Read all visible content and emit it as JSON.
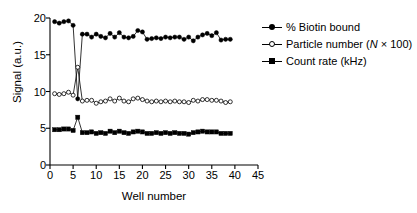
{
  "chart_data": {
    "type": "line",
    "title": "",
    "xlabel": "Well number",
    "ylabel": "Signal (a.u.)",
    "xlim": [
      0,
      45
    ],
    "ylim": [
      0,
      20
    ],
    "xticks": [
      0,
      5,
      10,
      15,
      20,
      25,
      30,
      35,
      40,
      45
    ],
    "yticks": [
      0,
      5,
      10,
      15,
      20
    ],
    "grid": false,
    "legend_position": "right",
    "x": [
      1,
      2,
      3,
      4,
      5,
      6,
      7,
      8,
      9,
      10,
      11,
      12,
      13,
      14,
      15,
      16,
      17,
      18,
      19,
      20,
      21,
      22,
      23,
      24,
      25,
      26,
      27,
      28,
      29,
      30,
      31,
      32,
      33,
      34,
      35,
      36,
      37,
      38,
      39
    ],
    "series": [
      {
        "name": "% Biotin bound",
        "marker": "filled-circle",
        "color": "#000000",
        "values": [
          19.5,
          19.3,
          19.5,
          19.6,
          19.0,
          9.0,
          17.8,
          17.8,
          17.4,
          17.8,
          17.5,
          17.3,
          17.9,
          17.4,
          18.0,
          17.4,
          17.3,
          17.5,
          18.3,
          18.1,
          17.1,
          17.2,
          17.3,
          17.2,
          17.4,
          17.3,
          17.4,
          17.4,
          17.1,
          17.4,
          16.9,
          17.4,
          17.7,
          17.9,
          17.6,
          18.0,
          17.0,
          17.1,
          17.1
        ]
      },
      {
        "name": "Particle number (N × 100)",
        "marker": "open-circle",
        "color": "#000000",
        "values": [
          9.7,
          9.6,
          9.7,
          9.9,
          9.5,
          13.3,
          8.7,
          8.8,
          8.8,
          8.4,
          8.6,
          8.7,
          9.0,
          8.7,
          9.1,
          8.7,
          8.6,
          9.0,
          9.1,
          8.9,
          8.7,
          8.6,
          8.7,
          8.6,
          8.7,
          8.6,
          8.7,
          8.6,
          8.6,
          8.5,
          8.8,
          8.7,
          8.9,
          8.9,
          8.8,
          8.8,
          8.7,
          8.5,
          8.6
        ]
      },
      {
        "name": "Count rate (kHz)",
        "marker": "filled-square",
        "color": "#000000",
        "values": [
          4.8,
          4.8,
          4.9,
          4.9,
          4.7,
          6.5,
          4.4,
          4.4,
          4.5,
          4.3,
          4.4,
          4.3,
          4.6,
          4.4,
          4.6,
          4.4,
          4.3,
          4.5,
          4.6,
          4.5,
          4.3,
          4.3,
          4.4,
          4.3,
          4.4,
          4.3,
          4.4,
          4.3,
          4.3,
          4.2,
          4.4,
          4.5,
          4.6,
          4.5,
          4.5,
          4.5,
          4.3,
          4.3,
          4.3
        ]
      }
    ]
  },
  "legend": {
    "items": [
      {
        "label": "% Biotin bound",
        "marker": "filled-circle-icon"
      },
      {
        "label_pre": "Particle number (",
        "label_italic": "N",
        "label_post": " × 100)",
        "marker": "open-circle-icon"
      },
      {
        "label": "Count rate (kHz)",
        "marker": "filled-square-icon"
      }
    ]
  }
}
